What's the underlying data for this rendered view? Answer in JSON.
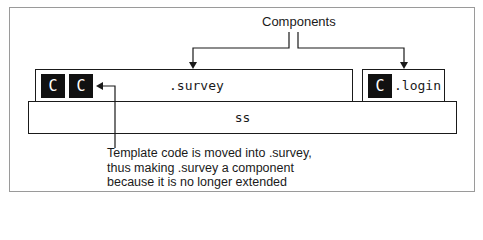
{
  "diagram": {
    "title_label": "Components",
    "boxes": {
      "survey": {
        "label": ".survey",
        "badges": [
          "C",
          "C"
        ]
      },
      "login": {
        "label": ".login",
        "badges": [
          "C"
        ]
      },
      "base": {
        "label": "ss"
      }
    },
    "annotation": {
      "lines": [
        "Template code is moved into .survey,",
        "thus making .survey a component",
        "because it is no longer extended"
      ]
    },
    "colors": {
      "stroke": "#1a1a1a",
      "badge_fill": "#111111",
      "badge_text": "#ffffff",
      "frame_border": "#9a9a9a"
    }
  }
}
